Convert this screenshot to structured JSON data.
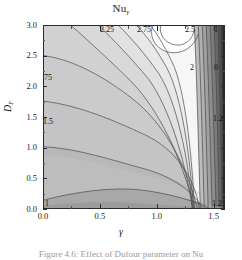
{
  "figure": {
    "title_main": "Nu",
    "title_sub": "γ",
    "caption": "Figure 4.6:  Effect of Dufour parameter on Nu"
  },
  "axes": {
    "x": {
      "label": "γ",
      "ticks": [
        "0.0",
        "0.5",
        "1.0",
        "1.5"
      ],
      "tick_values": [
        0.0,
        0.5,
        1.0,
        1.5
      ],
      "range": [
        0.0,
        1.6
      ]
    },
    "y": {
      "label_main": "D",
      "label_sub": "F",
      "ticks": [
        "0.0",
        "0.5",
        "1.0",
        "1.5",
        "2.0",
        "2.5",
        "3.0"
      ],
      "tick_values": [
        0.0,
        0.5,
        1.0,
        1.5,
        2.0,
        2.5,
        3.0
      ],
      "range": [
        0.0,
        3.0
      ]
    }
  },
  "contour_labels": [
    {
      "text": "2.25",
      "x": 100,
      "y": 26
    },
    {
      "text": "2.75",
      "x": 137,
      "y": 26
    },
    {
      "text": "2.5",
      "x": 185,
      "y": 26
    },
    {
      "text": "1",
      "x": 214,
      "y": 26
    },
    {
      "text": "2",
      "x": 190,
      "y": 64
    },
    {
      "text": "0",
      "x": 214,
      "y": 64
    },
    {
      "text": "75",
      "x": 44,
      "y": 74
    },
    {
      "text": "1.2",
      "x": 213,
      "y": 115
    },
    {
      "text": "1.5",
      "x": 43,
      "y": 118
    },
    {
      "text": "1",
      "x": 45,
      "y": 200
    },
    {
      "text": "1.2",
      "x": 212,
      "y": 200
    }
  ],
  "chart_data": {
    "type": "contour",
    "title": "Nuγ",
    "xlabel": "γ",
    "ylabel": "D_F",
    "xlim": [
      0.0,
      1.6
    ],
    "ylim": [
      0.0,
      3.0
    ],
    "grid": false,
    "legend": "none",
    "colormap": "grayscale",
    "contour_levels": [
      0,
      0.25,
      0.5,
      0.75,
      1,
      1.2,
      1.25,
      1.5,
      1.75,
      2,
      2.25,
      2.5,
      2.75,
      3
    ],
    "labeled_levels": [
      "0",
      "1",
      "1.2",
      "1.5",
      "1.75",
      "2",
      "2.25",
      "2.5",
      "2.75"
    ],
    "z_min": 0,
    "z_max": 3,
    "samples": {
      "x": [
        0.0,
        0.2,
        0.4,
        0.6,
        0.8,
        1.0,
        1.2,
        1.4,
        1.5,
        1.6
      ],
      "y": [
        0.0,
        0.5,
        1.0,
        1.5,
        2.0,
        2.5,
        3.0
      ],
      "z": [
        [
          1.05,
          1.08,
          1.12,
          1.16,
          1.18,
          1.17,
          1.14,
          1.18,
          1.22,
          0.95
        ],
        [
          1.35,
          1.4,
          1.46,
          1.52,
          1.55,
          1.53,
          1.48,
          1.42,
          1.3,
          0.7
        ],
        [
          1.58,
          1.64,
          1.72,
          1.8,
          1.85,
          1.84,
          1.78,
          1.62,
          1.35,
          0.55
        ],
        [
          1.74,
          1.82,
          1.93,
          2.04,
          2.12,
          2.14,
          2.06,
          1.8,
          1.4,
          0.42
        ],
        [
          1.86,
          1.97,
          2.12,
          2.28,
          2.41,
          2.45,
          2.34,
          1.96,
          1.44,
          0.3
        ],
        [
          1.95,
          2.09,
          2.29,
          2.52,
          2.7,
          2.76,
          2.6,
          2.08,
          1.46,
          0.18
        ],
        [
          2.02,
          2.19,
          2.44,
          2.72,
          2.93,
          2.99,
          2.8,
          2.16,
          1.48,
          0.08
        ]
      ]
    }
  }
}
